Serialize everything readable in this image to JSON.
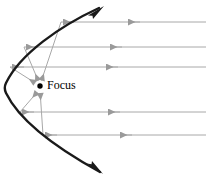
{
  "figure": {
    "kind": "parabolic-reflector-diagram",
    "width": 206,
    "height": 181,
    "background": "#ffffff",
    "labels": {
      "focus": "Focus"
    },
    "colors": {
      "parabola": "#1a1a1a",
      "ray": "#a8a8a8",
      "focus_dot": "#000000",
      "label_text": "#000000"
    },
    "focus_point": {
      "x": 40,
      "y": 86,
      "dot_radius": 2.6
    },
    "label_position": {
      "x": 46,
      "y": 80
    },
    "parabola": {
      "vertex_x": 4,
      "vertex_y": 88,
      "opens": "right",
      "stroke_width": 2.4,
      "arrow_ends": [
        "top",
        "bottom"
      ],
      "top_end": {
        "x": 102,
        "y": 6
      },
      "bottom_end": {
        "x": 100,
        "y": 174
      }
    },
    "incoming_rays": [
      {
        "id": "ray-1",
        "y": 22,
        "x_start": 206,
        "x_end": 61,
        "arrow_x": 130
      },
      {
        "id": "ray-2",
        "y": 47,
        "x_start": 206,
        "x_end": 24,
        "arrow_x": 112
      },
      {
        "id": "ray-3",
        "y": 67,
        "x_start": 206,
        "x_end": 10,
        "arrow_x": 108
      },
      {
        "id": "ray-4",
        "y": 112,
        "x_start": 206,
        "x_end": 20,
        "arrow_x": 110
      },
      {
        "id": "ray-5",
        "y": 135,
        "x_start": 206,
        "x_end": 43,
        "arrow_x": 122
      }
    ],
    "reflected_rays": [
      {
        "id": "reflected-1",
        "from_x": 61,
        "from_y": 22,
        "to_x": 40,
        "to_y": 86
      },
      {
        "id": "reflected-2",
        "from_x": 24,
        "from_y": 47,
        "to_x": 40,
        "to_y": 86
      },
      {
        "id": "reflected-3",
        "from_x": 10,
        "from_y": 67,
        "to_x": 40,
        "to_y": 86
      },
      {
        "id": "reflected-4",
        "from_x": 20,
        "from_y": 112,
        "to_x": 40,
        "to_y": 86
      },
      {
        "id": "reflected-5",
        "from_x": 43,
        "from_y": 135,
        "to_x": 40,
        "to_y": 86
      }
    ]
  }
}
